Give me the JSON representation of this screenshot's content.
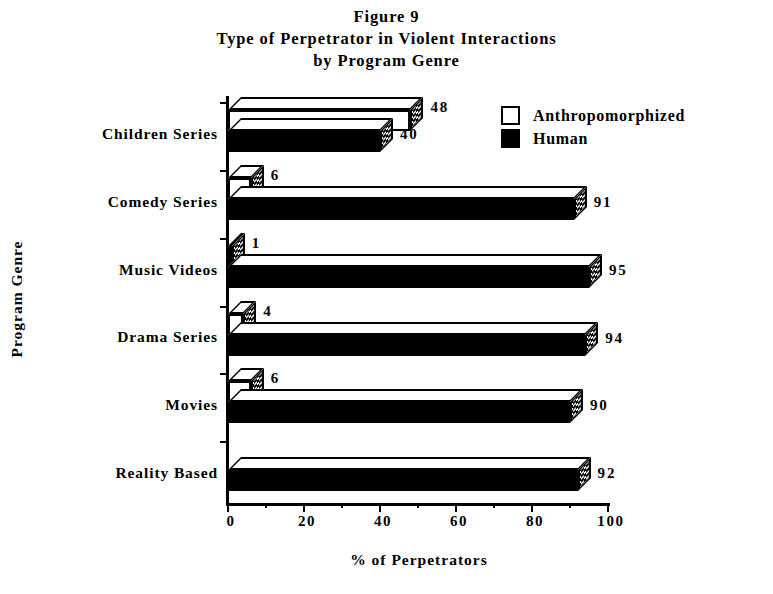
{
  "figure": {
    "number": "Figure 9",
    "title_line_1": "Type of Perpetrator in Violent Interactions",
    "title_line_2": "by Program Genre"
  },
  "legend": {
    "position": "top-right",
    "items": [
      {
        "label": "Anthropomorphized",
        "swatch": "white-outlined-square",
        "color": "#ffffff"
      },
      {
        "label": "Human",
        "swatch": "black-filled-square",
        "color": "#000000"
      }
    ]
  },
  "axes": {
    "x_label": "% of Perpetrators",
    "y_label": "Program Genre",
    "x_ticks": [
      "0",
      "20",
      "40",
      "60",
      "80",
      "100"
    ],
    "x_minor_step": 10
  },
  "chart_data": {
    "type": "bar",
    "orientation": "horizontal",
    "title": "Type of Perpetrator in Violent Interactions by Program Genre",
    "subtitle": "Figure 9",
    "xlabel": "% of Perpetrators",
    "ylabel": "Program Genre",
    "xlim": [
      0,
      100
    ],
    "xticks": [
      0,
      20,
      40,
      60,
      80,
      100
    ],
    "minor_xticks": [
      10,
      30,
      50,
      70,
      90
    ],
    "grid": false,
    "legend_position": "top-right",
    "categories": [
      "Children Series",
      "Comedy Series",
      "Music Videos",
      "Drama Series",
      "Movies",
      "Reality Based"
    ],
    "series": [
      {
        "name": "Anthropomorphized",
        "color": "#ffffff",
        "values": [
          48,
          6,
          1,
          4,
          6,
          0
        ]
      },
      {
        "name": "Human",
        "color": "#000000",
        "values": [
          40,
          91,
          95,
          94,
          90,
          92
        ]
      }
    ],
    "data_labels": {
      "Children Series": {
        "Anthropomorphized": "48",
        "Human": "40"
      },
      "Comedy Series": {
        "Anthropomorphized": "6",
        "Human": "91"
      },
      "Music Videos": {
        "Anthropomorphized": "1",
        "Human": "95"
      },
      "Drama Series": {
        "Anthropomorphized": "4",
        "Human": "94"
      },
      "Movies": {
        "Anthropomorphized": "6",
        "Human": "90"
      },
      "Reality Based": {
        "Anthropomorphized": "",
        "Human": "92"
      }
    }
  },
  "rendered": {
    "categories": [
      {
        "label": "Children Series",
        "anthro_value": "48",
        "human_value": "40"
      },
      {
        "label": "Comedy Series",
        "anthro_value": "6",
        "human_value": "91"
      },
      {
        "label": "Music Videos",
        "anthro_value": "1",
        "human_value": "95"
      },
      {
        "label": "Drama Series",
        "anthro_value": "4",
        "human_value": "94"
      },
      {
        "label": "Movies",
        "anthro_value": "6",
        "human_value": "90"
      },
      {
        "label": "Reality Based",
        "anthro_value": "",
        "human_value": "92"
      }
    ]
  }
}
